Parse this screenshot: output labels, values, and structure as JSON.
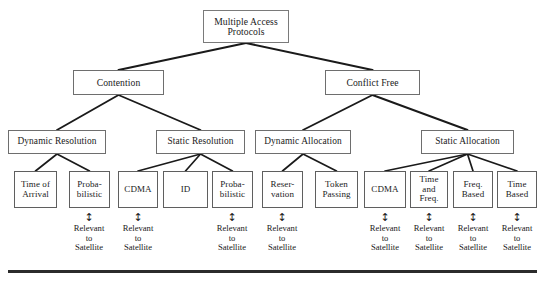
{
  "figure": {
    "background_color": "#ffffff",
    "line_color": "#1a1a1a",
    "box_border_color": "#6e6e6e",
    "rule_color": "#2b2b2b"
  },
  "chart_data": {
    "type": "diagram",
    "subtype": "hierarchy-tree",
    "title": "Multiple Access Protocols",
    "levels": 4,
    "nodes": [
      {
        "id": "root",
        "label": "Multiple Access\nProtocols",
        "level": 0,
        "x": 203,
        "y": 10,
        "w": 86,
        "h": 33
      },
      {
        "id": "cont",
        "label": "Contention",
        "level": 1,
        "x": 73,
        "y": 70,
        "w": 91,
        "h": 25
      },
      {
        "id": "cfree",
        "label": "Conflict Free",
        "level": 1,
        "x": 325,
        "y": 70,
        "w": 95,
        "h": 25
      },
      {
        "id": "dynres",
        "label": "Dynamic Resolution",
        "level": 2,
        "x": 8,
        "y": 130,
        "w": 98,
        "h": 24
      },
      {
        "id": "statres",
        "label": "Static Resolution",
        "level": 2,
        "x": 156,
        "y": 130,
        "w": 89,
        "h": 24
      },
      {
        "id": "dynalloc",
        "label": "Dynamic Allocation",
        "level": 2,
        "x": 255,
        "y": 130,
        "w": 96,
        "h": 24
      },
      {
        "id": "statallc",
        "label": "Static Allocation",
        "level": 2,
        "x": 421,
        "y": 130,
        "w": 93,
        "h": 24
      },
      {
        "id": "toa",
        "label": "Time of\nArrival",
        "level": 3,
        "x": 14,
        "y": 171,
        "w": 43,
        "h": 37
      },
      {
        "id": "prob1",
        "label": "Proba-\nbilistic",
        "level": 3,
        "x": 69,
        "y": 171,
        "w": 41,
        "h": 37
      },
      {
        "id": "cdma1",
        "label": "CDMA",
        "level": 3,
        "x": 118,
        "y": 171,
        "w": 40,
        "h": 37
      },
      {
        "id": "id",
        "label": "ID",
        "level": 3,
        "x": 163,
        "y": 171,
        "w": 45,
        "h": 37
      },
      {
        "id": "prob2",
        "label": "Proba-\nbilistic",
        "level": 3,
        "x": 212,
        "y": 171,
        "w": 41,
        "h": 37
      },
      {
        "id": "resv",
        "label": "Reser-\nvation",
        "level": 3,
        "x": 262,
        "y": 171,
        "w": 41,
        "h": 37
      },
      {
        "id": "token",
        "label": "Token\nPassing",
        "level": 3,
        "x": 315,
        "y": 171,
        "w": 43,
        "h": 37
      },
      {
        "id": "cdma2",
        "label": "CDMA",
        "level": 3,
        "x": 364,
        "y": 171,
        "w": 42,
        "h": 37
      },
      {
        "id": "timefreq",
        "label": "Time\nand\nFreq.",
        "level": 3,
        "x": 410,
        "y": 171,
        "w": 38,
        "h": 37
      },
      {
        "id": "freqb",
        "label": "Freq.\nBased",
        "level": 3,
        "x": 453,
        "y": 171,
        "w": 40,
        "h": 37
      },
      {
        "id": "timeb",
        "label": "Time\nBased",
        "level": 3,
        "x": 497,
        "y": 171,
        "w": 40,
        "h": 37
      }
    ],
    "edges": [
      {
        "from": "root",
        "to": "cont"
      },
      {
        "from": "root",
        "to": "cfree"
      },
      {
        "from": "cont",
        "to": "dynres"
      },
      {
        "from": "cont",
        "to": "statres"
      },
      {
        "from": "cfree",
        "to": "dynalloc"
      },
      {
        "from": "cfree",
        "to": "statallc"
      },
      {
        "from": "dynres",
        "to": "toa"
      },
      {
        "from": "dynres",
        "to": "prob1"
      },
      {
        "from": "statres",
        "to": "cdma1"
      },
      {
        "from": "statres",
        "to": "id"
      },
      {
        "from": "statres",
        "to": "prob2"
      },
      {
        "from": "dynalloc",
        "to": "resv"
      },
      {
        "from": "dynalloc",
        "to": "token"
      },
      {
        "from": "statallc",
        "to": "cdma2"
      },
      {
        "from": "statallc",
        "to": "timefreq"
      },
      {
        "from": "statallc",
        "to": "freqb"
      },
      {
        "from": "statallc",
        "to": "timeb"
      }
    ],
    "annotations": [
      {
        "id": "ann-prob1",
        "for": "prob1",
        "arrow": "↕",
        "label": "Relevant\nto\nSatellite",
        "cx": 89,
        "arrow_y": 212,
        "label_y": 224
      },
      {
        "id": "ann-cdma1",
        "for": "cdma1",
        "arrow": "↕",
        "label": "Relevant\nto\nSatellite",
        "cx": 138,
        "arrow_y": 212,
        "label_y": 224
      },
      {
        "id": "ann-prob2",
        "for": "prob2",
        "arrow": "↕",
        "label": "Relevant\nto\nSatellite",
        "cx": 232,
        "arrow_y": 212,
        "label_y": 224
      },
      {
        "id": "ann-resv",
        "for": "resv",
        "arrow": "↕",
        "label": "Relevant\nto\nSatellite",
        "cx": 282,
        "arrow_y": 212,
        "label_y": 224
      },
      {
        "id": "ann-cdma2",
        "for": "cdma2",
        "arrow": "↕",
        "label": "Relevant\nto\nSatellite",
        "cx": 385,
        "arrow_y": 212,
        "label_y": 224
      },
      {
        "id": "ann-timefreq",
        "for": "timefreq",
        "arrow": "↕",
        "label": "Relevant\nto\nSatellite",
        "cx": 429,
        "arrow_y": 212,
        "label_y": 224
      },
      {
        "id": "ann-freqb",
        "for": "freqb",
        "arrow": "↕",
        "label": "Relevant\nto\nSatellite",
        "cx": 473,
        "arrow_y": 212,
        "label_y": 224
      },
      {
        "id": "ann-timeb",
        "for": "timeb",
        "arrow": "↕",
        "label": "Relevant\nto\nSatellite",
        "cx": 517,
        "arrow_y": 212,
        "label_y": 224
      }
    ],
    "bottom_rule": {
      "x": 8,
      "y": 270,
      "w": 529,
      "h": 3
    }
  }
}
